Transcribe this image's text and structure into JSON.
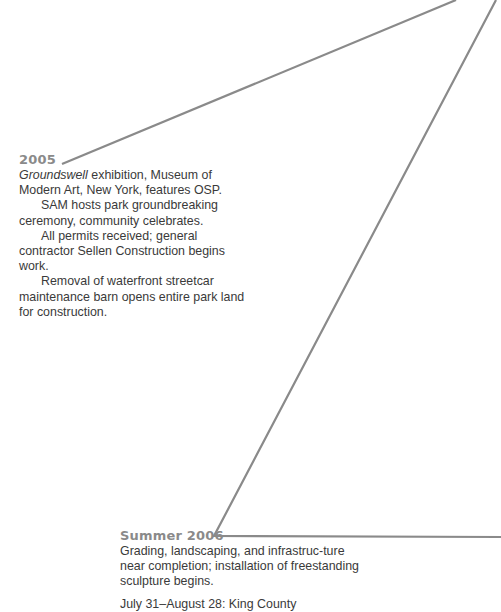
{
  "timeline": {
    "line_color": "#8a8a8a",
    "entries": [
      {
        "year": "2005",
        "paragraphs": [
          {
            "italic_lead": "Groundswell",
            "text": " exhibition, Museum of Modern Art, New York, features OSP."
          },
          {
            "text": "SAM hosts park groundbreaking ceremony, community celebrates."
          },
          {
            "text": "All permits received; general contractor Sellen Construction begins work."
          },
          {
            "text": "Removal of waterfront streetcar maintenance barn opens entire park land for construction."
          }
        ]
      },
      {
        "year": "Summer 2006",
        "paragraphs": [
          {
            "text": "Grading, landscaping, and infrastruc-ture near completion; installation of freestanding sculpture begins."
          },
          {
            "text": "July 31–August 28: King County"
          }
        ]
      }
    ]
  }
}
